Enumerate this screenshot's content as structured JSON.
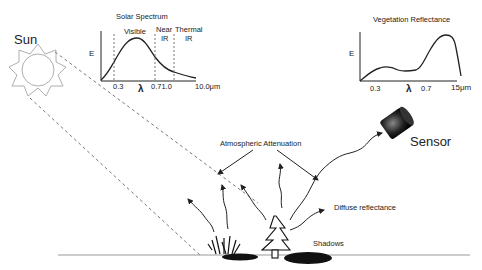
{
  "labels": {
    "sun": "Sun",
    "sensor": "Sensor",
    "atmospheric_attenuation": "Atmospheric Attenuation",
    "diffuse_reflectance": "Diffuse reflectance",
    "shadows": "Shadows"
  },
  "solar_spectrum": {
    "title": "Solar Spectrum",
    "ylabel": "E",
    "xlabel": "λ",
    "bands": [
      "Visible",
      "Near IR",
      "Thermal IR"
    ],
    "band_near_line1": "Near",
    "band_near_line2": "IR",
    "band_thermal_line1": "Thermal",
    "band_thermal_line2": "IR",
    "ticks": [
      "0.3",
      "0.71.0",
      "10.0μm"
    ]
  },
  "vegetation_reflectance": {
    "title": "Vegetation Reflectance",
    "ylabel": "E",
    "xlabel": "λ",
    "ticks": [
      "0.3",
      "0.7",
      "15μm"
    ]
  },
  "colors": {
    "line": "#222222",
    "dashed": "#777777",
    "sun_outline": "#999999",
    "ground": "#999999"
  }
}
